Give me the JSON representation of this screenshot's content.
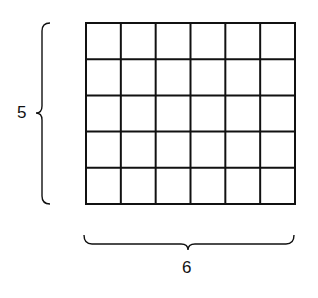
{
  "diagram": {
    "title": "",
    "grid": {
      "rows": 5,
      "columns": 6
    },
    "labels": {
      "height": "5",
      "width": "6"
    },
    "colors": {
      "line": "#111111",
      "background": "#ffffff"
    }
  }
}
